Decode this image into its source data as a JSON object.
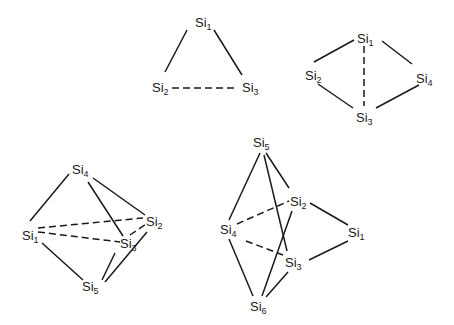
{
  "diagrams": [
    {
      "name": "Si3 triangle",
      "atoms": [
        {
          "label": "Si",
          "sub": "1",
          "x": 195,
          "y": 27
        },
        {
          "label": "Si",
          "sub": "2",
          "x": 152,
          "y": 92
        },
        {
          "label": "Si",
          "sub": "3",
          "x": 242,
          "y": 92
        }
      ],
      "bonds": [
        {
          "from": [
            187,
            30
          ],
          "to": [
            165,
            72
          ],
          "style": "solid"
        },
        {
          "from": [
            214,
            30
          ],
          "to": [
            242,
            75
          ],
          "style": "solid"
        },
        {
          "from": [
            172,
            88
          ],
          "to": [
            238,
            88
          ],
          "style": "dashed"
        }
      ]
    },
    {
      "name": "Si4 rhombus",
      "atoms": [
        {
          "label": "Si",
          "sub": "1",
          "x": 357,
          "y": 43
        },
        {
          "label": "Si",
          "sub": "2",
          "x": 305,
          "y": 80
        },
        {
          "label": "Si",
          "sub": "4",
          "x": 416,
          "y": 83
        },
        {
          "label": "Si",
          "sub": "3",
          "x": 356,
          "y": 122
        }
      ],
      "bonds": [
        {
          "from": [
            354,
            40
          ],
          "to": [
            314,
            62
          ],
          "style": "solid"
        },
        {
          "from": [
            382,
            41
          ],
          "to": [
            412,
            64
          ],
          "style": "solid"
        },
        {
          "from": [
            318,
            84
          ],
          "to": [
            353,
            108
          ],
          "style": "solid"
        },
        {
          "from": [
            419,
            85
          ],
          "to": [
            376,
            108
          ],
          "style": "solid"
        },
        {
          "from": [
            364,
            46
          ],
          "to": [
            364,
            106
          ],
          "style": "dashed"
        }
      ]
    },
    {
      "name": "Si5 trigonal bipyramid",
      "atoms": [
        {
          "label": "Si",
          "sub": "4",
          "x": 72,
          "y": 174
        },
        {
          "label": "Si",
          "sub": "1",
          "x": 22,
          "y": 240
        },
        {
          "label": "Si",
          "sub": "2",
          "x": 146,
          "y": 226
        },
        {
          "label": "Si",
          "sub": "3",
          "x": 120,
          "y": 248
        },
        {
          "label": "Si",
          "sub": "5",
          "x": 82,
          "y": 291
        }
      ],
      "bonds": [
        {
          "from": [
            69,
            174
          ],
          "to": [
            30,
            221
          ],
          "style": "solid"
        },
        {
          "from": [
            93,
            178
          ],
          "to": [
            145,
            215
          ],
          "style": "solid"
        },
        {
          "from": [
            88,
            182
          ],
          "to": [
            123,
            236
          ],
          "style": "solid"
        },
        {
          "from": [
            42,
            243
          ],
          "to": [
            83,
            280
          ],
          "style": "solid"
        },
        {
          "from": [
            115,
            253
          ],
          "to": [
            102,
            280
          ],
          "style": "solid"
        },
        {
          "from": [
            147,
            232
          ],
          "to": [
            105,
            282
          ],
          "style": "solid"
        },
        {
          "from": [
            38,
            228
          ],
          "to": [
            143,
            218
          ],
          "style": "dashed"
        },
        {
          "from": [
            38,
            232
          ],
          "to": [
            120,
            242
          ],
          "style": "dashed"
        },
        {
          "from": [
            130,
            235
          ],
          "to": [
            146,
            224
          ],
          "style": "dashed"
        }
      ]
    },
    {
      "name": "Si6 octahedron",
      "atoms": [
        {
          "label": "Si",
          "sub": "5",
          "x": 253,
          "y": 147
        },
        {
          "label": "Si",
          "sub": "2",
          "x": 290,
          "y": 206
        },
        {
          "label": "Si",
          "sub": "4",
          "x": 220,
          "y": 234
        },
        {
          "label": "Si",
          "sub": "1",
          "x": 348,
          "y": 237
        },
        {
          "label": "Si",
          "sub": "3",
          "x": 285,
          "y": 267
        },
        {
          "label": "Si",
          "sub": "6",
          "x": 250,
          "y": 311
        }
      ],
      "bonds": [
        {
          "from": [
            260,
            153
          ],
          "to": [
            229,
            220
          ],
          "style": "solid"
        },
        {
          "from": [
            266,
            153
          ],
          "to": [
            289,
            188
          ],
          "style": "solid"
        },
        {
          "from": [
            264,
            155
          ],
          "to": [
            287,
            251
          ],
          "style": "solid"
        },
        {
          "from": [
            310,
            203
          ],
          "to": [
            348,
            225
          ],
          "style": "solid"
        },
        {
          "from": [
            348,
            241
          ],
          "to": [
            309,
            260
          ],
          "style": "solid"
        },
        {
          "from": [
            229,
            239
          ],
          "to": [
            253,
            296
          ],
          "style": "solid"
        },
        {
          "from": [
            292,
            211
          ],
          "to": [
            262,
            296
          ],
          "style": "solid"
        },
        {
          "from": [
            288,
            272
          ],
          "to": [
            266,
            297
          ],
          "style": "solid"
        },
        {
          "from": [
            237,
            224
          ],
          "to": [
            289,
            201
          ],
          "style": "dashed"
        },
        {
          "from": [
            246,
            241
          ],
          "to": [
            283,
            255
          ],
          "style": "dashed"
        }
      ]
    }
  ]
}
